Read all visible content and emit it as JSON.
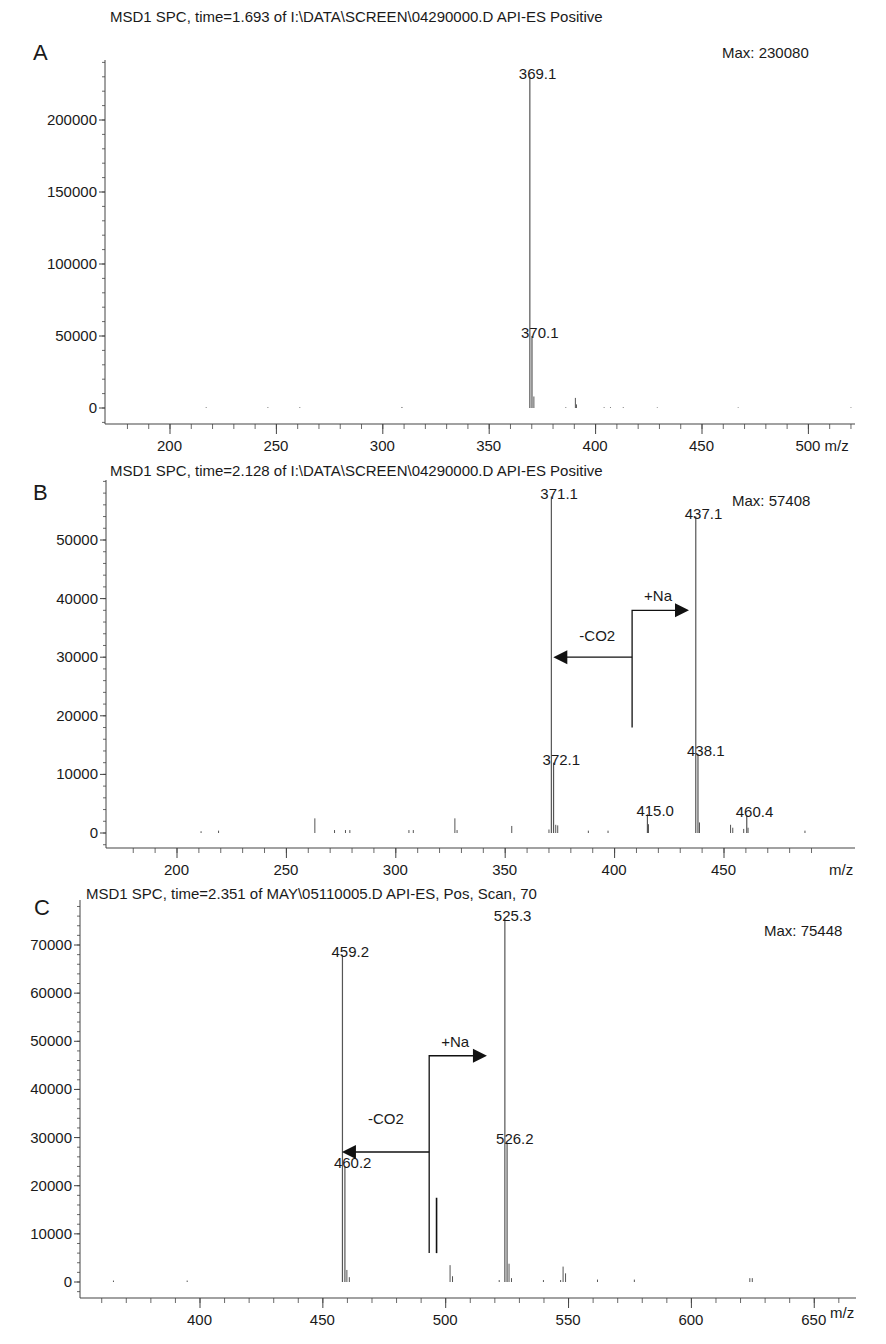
{
  "chart_data": [
    {
      "type": "bar",
      "panel": "A",
      "title": "MSD1 SPC, time=1.693 of I:\\DATA\\SCREEN\\04290000.D  API-ES Positive",
      "max_label": "Max: 230080",
      "xlabel": "m/z",
      "ylabel": "",
      "xlim": [
        172,
        522
      ],
      "ylim": [
        -12000,
        250000
      ],
      "x_ticks": [
        200,
        250,
        300,
        350,
        400,
        450,
        500
      ],
      "x_tick_labels": [
        "200",
        "250",
        "300",
        "350",
        "400",
        "450",
        "500 m/z"
      ],
      "y_ticks": [
        0,
        50000,
        100000,
        150000,
        200000
      ],
      "y_tick_labels": [
        "0",
        "50000",
        "100000",
        "150000",
        "200000"
      ],
      "grid": false,
      "peaks": [
        {
          "mz": 369.1,
          "intensity": 230080,
          "label": "369.1"
        },
        {
          "mz": 370.1,
          "intensity": 50000,
          "label": "370.1"
        },
        {
          "mz": 371.0,
          "intensity": 8000
        },
        {
          "mz": 390.5,
          "intensity": 7000
        },
        {
          "mz": 391.0,
          "intensity": 2500
        },
        {
          "mz": 217,
          "intensity": 500
        },
        {
          "mz": 246,
          "intensity": 500
        },
        {
          "mz": 261,
          "intensity": 500
        },
        {
          "mz": 309,
          "intensity": 700
        },
        {
          "mz": 386,
          "intensity": 500
        },
        {
          "mz": 404,
          "intensity": 500
        },
        {
          "mz": 407,
          "intensity": 500
        },
        {
          "mz": 413,
          "intensity": 500
        },
        {
          "mz": 429,
          "intensity": 400
        },
        {
          "mz": 467,
          "intensity": 400
        },
        {
          "mz": 520,
          "intensity": 400
        }
      ],
      "annotations": []
    },
    {
      "type": "bar",
      "panel": "B",
      "title": "MSD1 SPC, time=2.128 of I:\\DATA\\SCREEN\\04290000.D  API-ES Positive",
      "max_label": "Max: 57408",
      "xlabel": "m/z",
      "ylabel": "",
      "xlim": [
        172,
        492
      ],
      "ylim": [
        -2500,
        60000
      ],
      "x_ticks": [
        200,
        250,
        300,
        350,
        400,
        450
      ],
      "x_tick_labels": [
        "200",
        "250",
        "300",
        "350",
        "400",
        "450"
      ],
      "y_ticks": [
        0,
        10000,
        20000,
        30000,
        40000,
        50000
      ],
      "y_tick_labels": [
        "0",
        "10000",
        "20000",
        "30000",
        "40000",
        "50000"
      ],
      "grid": false,
      "peaks": [
        {
          "mz": 371.1,
          "intensity": 57408,
          "label": "371.1"
        },
        {
          "mz": 372.1,
          "intensity": 12000,
          "label": "372.1"
        },
        {
          "mz": 437.1,
          "intensity": 54000,
          "label": "437.1"
        },
        {
          "mz": 438.1,
          "intensity": 13500,
          "label": "438.1"
        },
        {
          "mz": 415.0,
          "intensity": 3200,
          "label": "415.0"
        },
        {
          "mz": 460.4,
          "intensity": 3000,
          "label": "460.4"
        },
        {
          "mz": 263,
          "intensity": 2500
        },
        {
          "mz": 327,
          "intensity": 2500
        },
        {
          "mz": 353,
          "intensity": 1200
        },
        {
          "mz": 370,
          "intensity": 600
        },
        {
          "mz": 373.1,
          "intensity": 1400
        },
        {
          "mz": 374,
          "intensity": 1300
        },
        {
          "mz": 415.5,
          "intensity": 1500
        },
        {
          "mz": 438.8,
          "intensity": 1800
        },
        {
          "mz": 453,
          "intensity": 1400
        },
        {
          "mz": 454,
          "intensity": 900
        },
        {
          "mz": 459,
          "intensity": 700
        },
        {
          "mz": 461,
          "intensity": 900
        },
        {
          "mz": 211,
          "intensity": 300
        },
        {
          "mz": 219,
          "intensity": 400
        },
        {
          "mz": 272,
          "intensity": 500
        },
        {
          "mz": 277,
          "intensity": 500
        },
        {
          "mz": 279,
          "intensity": 500
        },
        {
          "mz": 306,
          "intensity": 500
        },
        {
          "mz": 308,
          "intensity": 500
        },
        {
          "mz": 328,
          "intensity": 500
        },
        {
          "mz": 388,
          "intensity": 400
        },
        {
          "mz": 397,
          "intensity": 400
        },
        {
          "mz": 487,
          "intensity": 400
        }
      ],
      "annotations": [
        {
          "text": "+Na",
          "type": "arrow-right",
          "from_mz": 408,
          "to_mz": 434,
          "y": 38000,
          "stem_bottom": 18000
        },
        {
          "text": "-CO2",
          "type": "arrow-left",
          "from_mz": 408,
          "to_mz": 372,
          "y": 30000
        }
      ]
    },
    {
      "type": "bar",
      "panel": "C",
      "title": "MSD1 SPC, time=2.351 of MAY\\05110005.D     API-ES, Pos, Scan, 70",
      "max_label": "Max: 75448",
      "xlabel": "m/z",
      "ylabel": "",
      "xlim": [
        352,
        692
      ],
      "ylim": [
        -3500,
        80000
      ],
      "x_ticks": [
        400,
        450,
        500,
        550,
        600,
        650
      ],
      "x_tick_labels": [
        "400",
        "450",
        "500",
        "550",
        "600",
        "650"
      ],
      "y_ticks": [
        0,
        10000,
        20000,
        30000,
        40000,
        50000,
        60000,
        70000
      ],
      "y_tick_labels": [
        "0",
        "10000",
        "20000",
        "30000",
        "40000",
        "50000",
        "60000",
        "70000"
      ],
      "grid": false,
      "peaks": [
        {
          "mz": 459.2,
          "intensity": 68000,
          "label": "459.2"
        },
        {
          "mz": 460.2,
          "intensity": 24000,
          "label": "460.2"
        },
        {
          "mz": 525.3,
          "intensity": 75448,
          "label": "525.3"
        },
        {
          "mz": 526.2,
          "intensity": 29000,
          "label": "526.2"
        },
        {
          "mz": 461,
          "intensity": 2500
        },
        {
          "mz": 462,
          "intensity": 1000
        },
        {
          "mz": 503,
          "intensity": 3500
        },
        {
          "mz": 504,
          "intensity": 1200
        },
        {
          "mz": 527,
          "intensity": 3800
        },
        {
          "mz": 528,
          "intensity": 800
        },
        {
          "mz": 549,
          "intensity": 3200
        },
        {
          "mz": 550,
          "intensity": 1800
        },
        {
          "mz": 366,
          "intensity": 300
        },
        {
          "mz": 396,
          "intensity": 300
        },
        {
          "mz": 523,
          "intensity": 400
        },
        {
          "mz": 541,
          "intensity": 400
        },
        {
          "mz": 548,
          "intensity": 400
        },
        {
          "mz": 563,
          "intensity": 500
        },
        {
          "mz": 578,
          "intensity": 500
        },
        {
          "mz": 625,
          "intensity": 800
        },
        {
          "mz": 626,
          "intensity": 800
        }
      ],
      "annotations": [
        {
          "text": "+Na",
          "type": "arrow-right",
          "from_mz": 494.5,
          "to_mz": 518,
          "y": 47000,
          "stem_bottom": 6000
        },
        {
          "text": "-CO2",
          "type": "arrow-left",
          "from_mz": 494.5,
          "to_mz": 459,
          "y": 27000
        },
        {
          "text": "",
          "type": "bar",
          "from_mz": 497.5,
          "y_top": 17500,
          "y_bottom": 6000
        }
      ]
    }
  ],
  "panels": [
    {
      "letter": "A"
    },
    {
      "letter": "B"
    },
    {
      "letter": "C"
    }
  ],
  "colors": {
    "axis": "#444444",
    "peak": "#555555",
    "text": "#1a1a1a",
    "arrow": "#111111"
  }
}
